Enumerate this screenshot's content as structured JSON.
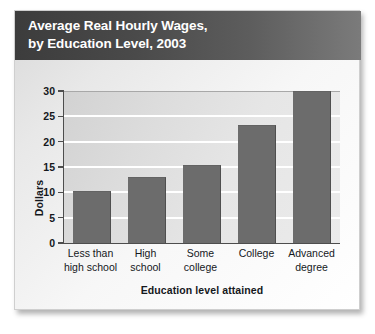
{
  "card": {
    "title_line_1": "Average Real Hourly Wages,",
    "title_line_2": "by Education Level, 2003"
  },
  "chart_data": {
    "type": "bar",
    "title": "Average Real Hourly Wages, by Education Level, 2003",
    "xlabel": "Education level attained",
    "ylabel": "Dollars",
    "categories": [
      "Less than high school",
      "High school",
      "Some college",
      "College",
      "Advanced degree"
    ],
    "category_lines": [
      [
        "Less than",
        "high school"
      ],
      [
        "High",
        "school"
      ],
      [
        "Some",
        "college"
      ],
      [
        "College",
        ""
      ],
      [
        "Advanced",
        "degree"
      ]
    ],
    "values": [
      10.2,
      13.0,
      15.3,
      23.3,
      30.0
    ],
    "ylim": [
      0,
      30
    ],
    "yticks": [
      0,
      5,
      10,
      15,
      20,
      25,
      30
    ],
    "ytick_labels": [
      "0",
      "5",
      "10",
      "15",
      "20",
      "25",
      "30"
    ],
    "grid": true,
    "legend": "none",
    "bar_color": "#6c6c6c",
    "plot_background": "#e0e0e0",
    "gridline_color": "#ffffff",
    "axis_color": "#4d4d4d",
    "title_bar_color": "#4a4a4a",
    "title_text_color": "#ffffff"
  }
}
